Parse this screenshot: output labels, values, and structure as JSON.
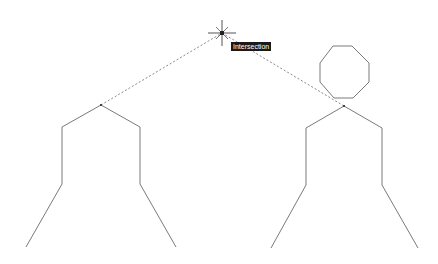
{
  "drawing": {
    "background": "#ffffff",
    "stroke_color": "#7a7a7a",
    "tracking_color": "#8a8a8a",
    "left_figure": {
      "points": [
        [
          26,
          247
        ],
        [
          62,
          184
        ],
        [
          62,
          127
        ],
        [
          101,
          105
        ],
        [
          140,
          127
        ],
        [
          140,
          184
        ],
        [
          176,
          247
        ]
      ]
    },
    "right_figure": {
      "points": [
        [
          271,
          248
        ],
        [
          306,
          185
        ],
        [
          306,
          128
        ],
        [
          344,
          106
        ],
        [
          382,
          128
        ],
        [
          382,
          185
        ],
        [
          418,
          248
        ]
      ]
    },
    "octagon": {
      "points": [
        [
          333,
          46
        ],
        [
          352,
          46
        ],
        [
          369,
          63
        ],
        [
          369,
          82
        ],
        [
          353,
          98
        ],
        [
          334,
          98
        ],
        [
          320,
          82
        ],
        [
          320,
          63
        ]
      ]
    },
    "tracking_lines": [
      {
        "from": [
          101,
          105
        ],
        "to": [
          222,
          33
        ]
      },
      {
        "from": [
          222,
          33
        ],
        "to": [
          344,
          106
        ]
      }
    ],
    "cursor": {
      "x": 222,
      "y": 33,
      "icon": "crosshair-cursor-icon"
    }
  },
  "snap_tooltip": {
    "label": "Intersection",
    "x": 231,
    "y": 42
  }
}
